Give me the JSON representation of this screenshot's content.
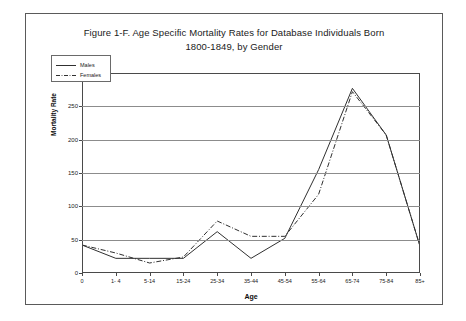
{
  "figure": {
    "title_line1": "Figure 1-F.  Age Specific Mortality Rates for Database Individuals Born",
    "title_line2": "1800-1849, by Gender"
  },
  "chart_data": {
    "type": "line",
    "title": "Figure 1-F.  Age Specific Mortality Rates for Database Individuals Born 1800-1849, by Gender",
    "xlabel": "Age",
    "ylabel": "Mortality Rate",
    "categories": [
      "0",
      "1- 4",
      "5-14",
      "15-24",
      "25-34",
      "35-44",
      "45-54",
      "55-64",
      "65-74",
      "75-84",
      "85+"
    ],
    "ylim": [
      0,
      300
    ],
    "yticks": [
      0,
      50,
      100,
      150,
      200,
      250,
      300
    ],
    "ytick_labels": [
      "0",
      "50",
      "100",
      "150",
      "200",
      "250",
      "300"
    ],
    "grid": true,
    "legend_position": "upper left",
    "series": [
      {
        "name": "Males",
        "style": "solid",
        "color": "#303030",
        "values": [
          42,
          22,
          22,
          22,
          62,
          22,
          52,
          155,
          277,
          207,
          40
        ]
      },
      {
        "name": "Females",
        "style": "dash-dot",
        "color": "#303030",
        "values": [
          42,
          30,
          15,
          24,
          78,
          55,
          55,
          118,
          272,
          207,
          40
        ]
      }
    ]
  }
}
